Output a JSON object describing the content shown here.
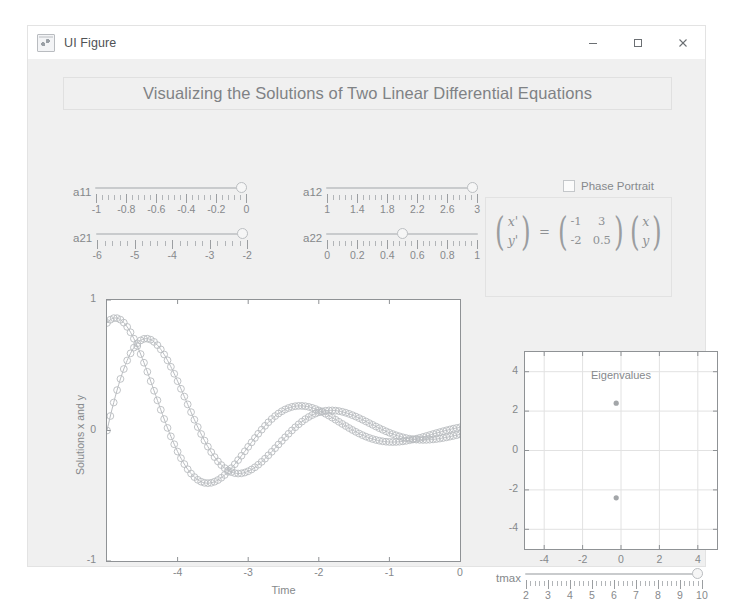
{
  "window": {
    "title": "UI Figure",
    "icon": "matlab-figure-icon",
    "controls": {
      "minimize": "minimize-icon",
      "maximize": "maximize-icon",
      "close": "close-icon"
    }
  },
  "header": {
    "title": "Visualizing the Solutions of Two Linear Differential Equations"
  },
  "sliders": [
    {
      "id": "a11",
      "label": "a11",
      "min": -1,
      "max": 0,
      "value": 0,
      "tick_labels": [
        "-1",
        "-0.8",
        "-0.6",
        "-0.4",
        "-0.2",
        "0"
      ],
      "tick_values": [
        -1,
        -0.8,
        -0.6,
        -0.4,
        -0.2,
        0
      ]
    },
    {
      "id": "a12",
      "label": "a12",
      "min": 1,
      "max": 3,
      "value": 3,
      "tick_labels": [
        "1",
        "1.4",
        "1.8",
        "2.2",
        "2.6",
        "3"
      ],
      "tick_values": [
        1,
        1.4,
        1.8,
        2.2,
        2.6,
        3
      ]
    },
    {
      "id": "a21",
      "label": "a21",
      "min": -6,
      "max": -2,
      "value": -2,
      "tick_labels": [
        "-6",
        "-5",
        "-4",
        "-3",
        "-2"
      ],
      "tick_values": [
        -6,
        -5,
        -4,
        -3,
        -2
      ]
    },
    {
      "id": "a22",
      "label": "a22",
      "min": 0,
      "max": 1,
      "value": 0.5,
      "tick_labels": [
        "0",
        "0.2",
        "0.4",
        "0.6",
        "0.8",
        "1"
      ],
      "tick_values": [
        0,
        0.2,
        0.4,
        0.6,
        0.8,
        1
      ]
    }
  ],
  "tmax_slider": {
    "id": "tmax",
    "label": "tmax",
    "min": 2,
    "max": 10,
    "value": 10,
    "tick_labels": [
      "2",
      "3",
      "4",
      "5",
      "6",
      "7",
      "8",
      "9",
      "10"
    ],
    "tick_values": [
      2,
      3,
      4,
      5,
      6,
      7,
      8,
      9,
      10
    ]
  },
  "phase_portrait": {
    "label": "Phase Portrait",
    "checked": false
  },
  "equation": {
    "lhs": [
      "x'",
      "y'"
    ],
    "equals": "=",
    "matrix": [
      [
        "-1",
        "3"
      ],
      [
        "-2",
        "0.5"
      ]
    ],
    "rhs": [
      "x",
      "y"
    ]
  },
  "chart_data": [
    {
      "type": "line",
      "name": "solutions-plot",
      "title": "",
      "xlabel": "Time",
      "ylabel": "Solutions x and y",
      "xlim": [
        -5,
        0
      ],
      "ylim": [
        -1,
        1
      ],
      "xticks": [
        -4,
        -3,
        -2,
        -1
      ],
      "xticklabels": [
        "-4",
        "-3",
        "-2",
        "-1"
      ],
      "yticks": [
        1,
        0,
        -1
      ],
      "yticklabels": [
        "1",
        "0",
        "-1"
      ],
      "grid": false,
      "marker": "circle",
      "series": [
        {
          "name": "x(t)",
          "color": "#b9bcc0",
          "decay_rate": 0.25,
          "frequency": 2.4,
          "phase": 0.0,
          "amplitude": 1.0
        },
        {
          "name": "y(t)",
          "color": "#b9bcc0",
          "decay_rate": 0.25,
          "frequency": 2.4,
          "phase": 1.05,
          "amplitude": 0.95
        }
      ]
    },
    {
      "type": "scatter",
      "name": "eigenvalues-plot",
      "title": "Eigenvalues",
      "xlabel": "",
      "ylabel": "",
      "xlim": [
        -5,
        5
      ],
      "ylim": [
        -5,
        5
      ],
      "xticks": [
        -4,
        -2,
        0,
        2,
        4
      ],
      "xticklabels": [
        "-4",
        "-2",
        "0",
        "2",
        "4"
      ],
      "yticks": [
        4,
        2,
        0,
        -2,
        -4
      ],
      "yticklabels": [
        "4",
        "2",
        "0",
        "-2",
        "-4"
      ],
      "grid": true,
      "points": [
        {
          "x": -0.25,
          "y": 2.4
        },
        {
          "x": -0.25,
          "y": -2.4
        }
      ],
      "marker_color": "#a3a6a9"
    }
  ]
}
